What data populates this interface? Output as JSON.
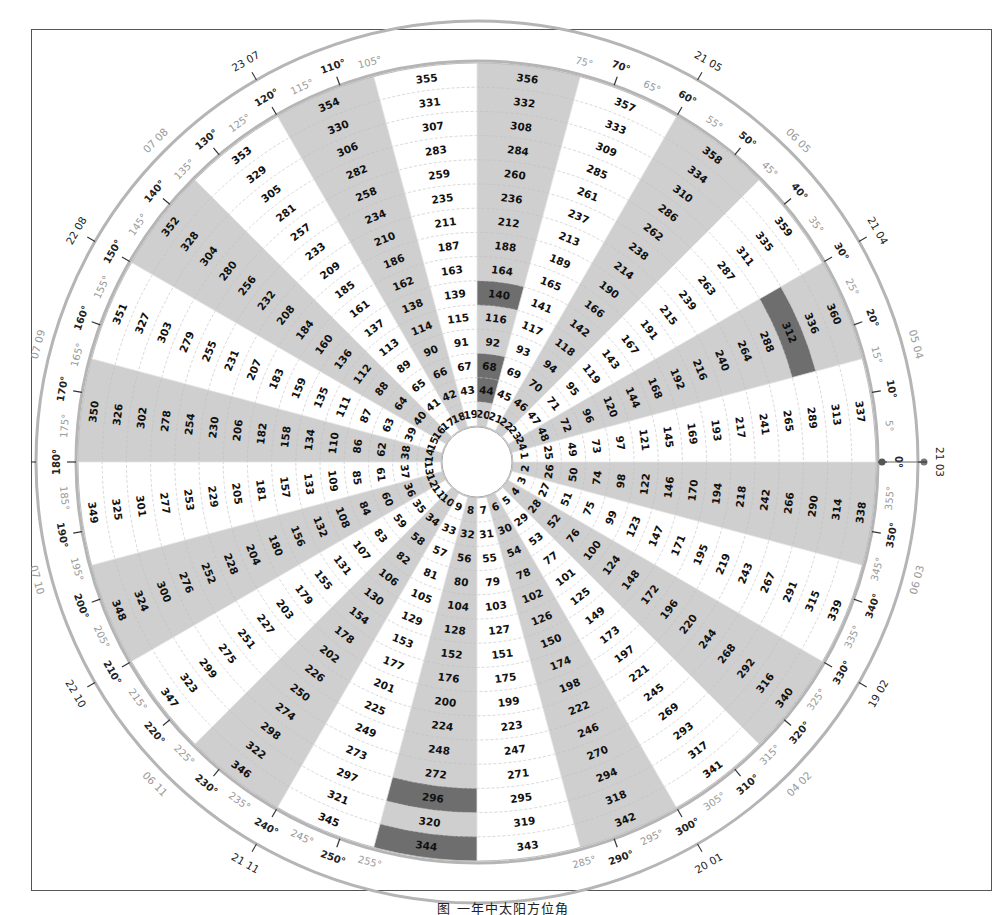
{
  "diagram": {
    "type": "polar-day-of-year-dial",
    "center": {
      "x": 477,
      "y": 462
    },
    "inner_radius": 36,
    "ring_width": 24.2,
    "rings": 15,
    "sectors": 24,
    "sector_span_deg": 15,
    "colors": {
      "shade": "#cfcfcf",
      "highlight": "#6e6e6e",
      "ring_line": "#bdbdbd",
      "outer_ring": "#b5b5b5",
      "tick": "#333333"
    },
    "numbering": "Sector k (1..24) contains days k + 24*n for n = 0..14; sector k spans from (15 - 15k)° to (15 - 15(k-1))° measured counter-clockwise from east; odd sectors shaded",
    "shaded_sectors": [
      2,
      4,
      6,
      8,
      10,
      12,
      14,
      16,
      18,
      20,
      22,
      24
    ],
    "highlighted_days": [
      312,
      344,
      296,
      44,
      68,
      140
    ],
    "major_degree_labels": [
      "0°",
      "10°",
      "20°",
      "30°",
      "40°",
      "50°",
      "60°",
      "70°",
      "110°",
      "120°",
      "130°",
      "140°",
      "150°",
      "160°",
      "170°",
      "180°",
      "190°",
      "200°",
      "210°",
      "220°",
      "230°",
      "240°",
      "250°",
      "290°",
      "300°",
      "310°",
      "320°",
      "330°",
      "340°",
      "350°"
    ],
    "minor_degree_labels": [
      "5°",
      "15°",
      "25°",
      "35°",
      "45°",
      "55°",
      "65°",
      "75°",
      "105°",
      "115°",
      "125°",
      "135°",
      "145°",
      "155°",
      "165°",
      "175°",
      "185°",
      "195°",
      "205°",
      "215°",
      "225°",
      "235°",
      "245°",
      "255°",
      "285°",
      "295°",
      "305°",
      "315°",
      "325°",
      "335°",
      "345°",
      "355°"
    ],
    "date_labels": [
      {
        "text": "21 03",
        "angle": 0,
        "style": "major"
      },
      {
        "text": "05 04",
        "angle": 15,
        "style": "minor"
      },
      {
        "text": "21 04",
        "angle": 30,
        "style": "major"
      },
      {
        "text": "06 05",
        "angle": 45,
        "style": "minor"
      },
      {
        "text": "21 05",
        "angle": 60,
        "style": "major"
      },
      {
        "text": "23 07",
        "angle": 120,
        "style": "major"
      },
      {
        "text": "07 08",
        "angle": 135,
        "style": "minor"
      },
      {
        "text": "22 08",
        "angle": 150,
        "style": "major"
      },
      {
        "text": "07 09",
        "angle": 165,
        "style": "minor"
      },
      {
        "text": "22 09",
        "angle": 180,
        "style": "major"
      },
      {
        "text": "07 10",
        "angle": 195,
        "style": "minor"
      },
      {
        "text": "22 10",
        "angle": 210,
        "style": "major"
      },
      {
        "text": "06 11",
        "angle": 225,
        "style": "minor"
      },
      {
        "text": "21 11",
        "angle": 240,
        "style": "major"
      },
      {
        "text": "20 01",
        "angle": 300,
        "style": "major"
      },
      {
        "text": "04 02",
        "angle": 315,
        "style": "minor"
      },
      {
        "text": "19 02",
        "angle": 330,
        "style": "major"
      },
      {
        "text": "06 03",
        "angle": 345,
        "style": "minor"
      }
    ],
    "zero_marker": {
      "angle": 0,
      "label": "0°"
    }
  },
  "caption": "图 一年中太阳方位角"
}
